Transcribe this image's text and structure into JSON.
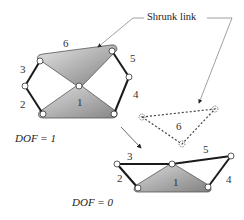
{
  "diagram": {
    "callout_label": "Shrunk link",
    "top_mechanism": {
      "link_labels": {
        "l1": "1",
        "l2": "2",
        "l3": "3",
        "l4": "4",
        "l5": "5",
        "l6": "6"
      },
      "dof_label": "DOF = 1"
    },
    "shrunk_link": {
      "label": "6"
    },
    "bottom_mechanism": {
      "link_labels": {
        "l1": "1",
        "l2": "2",
        "l3": "3",
        "l4": "4",
        "l5": "5"
      },
      "dof_label": "DOF = 0"
    },
    "colors": {
      "link_fill_light": "#d9d9d9",
      "link_fill_dark": "#8c8c8c",
      "bar_stroke": "#1a1a1a",
      "leader_line": "#777777"
    }
  }
}
